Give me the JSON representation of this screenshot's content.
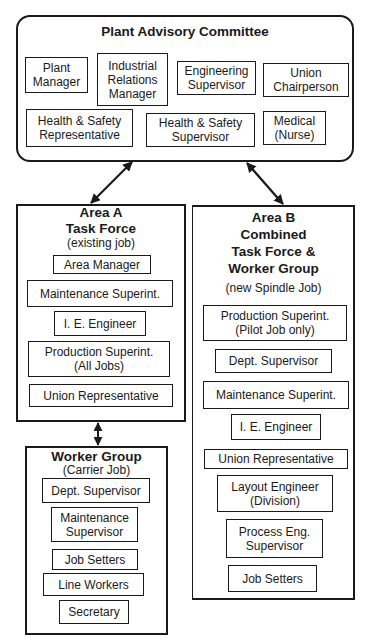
{
  "committee": {
    "title": "Plant Advisory Committee",
    "members": [
      {
        "label": "Plant\nManager"
      },
      {
        "label": "Industrial\nRelations\nManager"
      },
      {
        "label": "Engineering\nSupervisor"
      },
      {
        "label": "Union\nChairperson"
      },
      {
        "label": "Health & Safety\nRepresentative"
      },
      {
        "label": "Health & Safety\nSupervisor"
      },
      {
        "label": "Medical\n(Nurse)"
      }
    ]
  },
  "area_a": {
    "title": "Area A\nTask Force",
    "subtitle": "(existing job)",
    "members": [
      {
        "label": "Area Manager"
      },
      {
        "label": "Maintenance Superint."
      },
      {
        "label": "I. E. Engineer"
      },
      {
        "label": "Production Superint.\n(All Jobs)"
      },
      {
        "label": "Union Representative"
      }
    ]
  },
  "worker_group": {
    "title": "Worker Group",
    "subtitle": "(Carrier Job)",
    "members": [
      {
        "label": "Dept. Supervisor"
      },
      {
        "label": "Maintenance\nSupervisor"
      },
      {
        "label": "Job Setters"
      },
      {
        "label": "Line Workers"
      },
      {
        "label": "Secretary"
      }
    ]
  },
  "area_b": {
    "title": "Area B\nCombined\nTask Force &\nWorker Group",
    "subtitle": "(new Spindle Job)",
    "members": [
      {
        "label": "Production Superint.\n(Pilot Job only)"
      },
      {
        "label": "Dept. Supervisor"
      },
      {
        "label": "Maintenance Superint."
      },
      {
        "label": "I. E. Engineer"
      },
      {
        "label": "Union Representative"
      },
      {
        "label": "Layout Engineer\n(Division)"
      },
      {
        "label": "Process Eng.\nSupervisor"
      },
      {
        "label": "Job Setters"
      }
    ]
  },
  "connections": [
    {
      "from": "Plant Advisory Committee",
      "to": "Area A Task Force",
      "type": "bidirectional-arrow"
    },
    {
      "from": "Plant Advisory Committee",
      "to": "Area B Combined Task Force & Worker Group",
      "type": "bidirectional-arrow"
    },
    {
      "from": "Area A Task Force",
      "to": "Worker Group",
      "type": "bidirectional-arrow"
    }
  ],
  "colors": {
    "line": "#1a1a1a",
    "background": "#ffffff"
  }
}
